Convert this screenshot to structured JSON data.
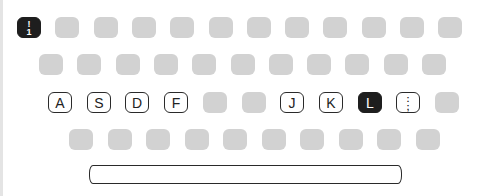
{
  "keyboard": {
    "rows": [
      {
        "top": 17,
        "left": 17,
        "pitch": 38.3,
        "keys": [
          {
            "label": "!",
            "sub": "1",
            "style": "dark"
          },
          {
            "label": "",
            "style": "blank"
          },
          {
            "label": "",
            "style": "blank"
          },
          {
            "label": "",
            "style": "blank"
          },
          {
            "label": "",
            "style": "blank"
          },
          {
            "label": "",
            "style": "blank"
          },
          {
            "label": "",
            "style": "blank"
          },
          {
            "label": "",
            "style": "blank"
          },
          {
            "label": "",
            "style": "blank"
          },
          {
            "label": "",
            "style": "blank"
          },
          {
            "label": "",
            "style": "blank"
          },
          {
            "label": "",
            "style": "blank"
          }
        ]
      },
      {
        "top": 54,
        "left": 39,
        "pitch": 38.3,
        "keys": [
          {
            "label": "",
            "style": "blank"
          },
          {
            "label": "",
            "style": "blank"
          },
          {
            "label": "",
            "style": "blank"
          },
          {
            "label": "",
            "style": "blank"
          },
          {
            "label": "",
            "style": "blank"
          },
          {
            "label": "",
            "style": "blank"
          },
          {
            "label": "",
            "style": "blank"
          },
          {
            "label": "",
            "style": "blank"
          },
          {
            "label": "",
            "style": "blank"
          },
          {
            "label": "",
            "style": "blank"
          },
          {
            "label": "",
            "style": "blank"
          }
        ]
      },
      {
        "top": 92,
        "left": 48,
        "pitch": 38.7,
        "keys": [
          {
            "label": "A",
            "style": "outline"
          },
          {
            "label": "S",
            "style": "outline"
          },
          {
            "label": "D",
            "style": "outline"
          },
          {
            "label": "F",
            "style": "outline"
          },
          {
            "label": "",
            "style": "blank"
          },
          {
            "label": "",
            "style": "blank"
          },
          {
            "label": "J",
            "style": "outline"
          },
          {
            "label": "K",
            "style": "outline"
          },
          {
            "label": "L",
            "style": "dark"
          },
          {
            "label": ":",
            "sub": ";",
            "style": "outline"
          },
          {
            "label": "",
            "style": "blank"
          }
        ]
      },
      {
        "top": 129,
        "left": 69,
        "pitch": 38.5,
        "keys": [
          {
            "label": "",
            "style": "blank"
          },
          {
            "label": "",
            "style": "blank"
          },
          {
            "label": "",
            "style": "blank"
          },
          {
            "label": "",
            "style": "blank"
          },
          {
            "label": "",
            "style": "blank"
          },
          {
            "label": "",
            "style": "blank"
          },
          {
            "label": "",
            "style": "blank"
          },
          {
            "label": "",
            "style": "blank"
          },
          {
            "label": "",
            "style": "blank"
          },
          {
            "label": "",
            "style": "blank"
          }
        ]
      }
    ],
    "spacebar": {
      "label": ""
    },
    "colors": {
      "blank": "#d2d2d2",
      "dark": "#1e1e1e",
      "outline": "#2a2a2a"
    }
  }
}
